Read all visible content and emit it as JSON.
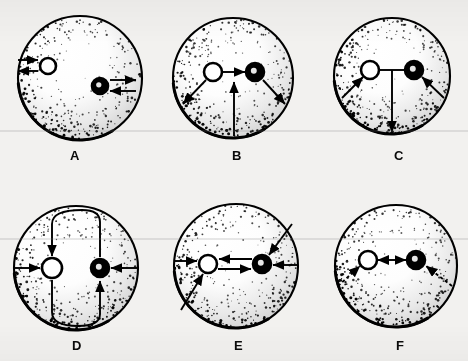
{
  "figure": {
    "background_color": "#f2f1ef",
    "ink_color": "#000000",
    "panel_count": 6,
    "sphere_fill": "#ffffff",
    "sphere_outline": "#000000"
  },
  "markers": {
    "open_circle_name": "open-circle-marker",
    "filled_circle_name": "filled-circle-marker",
    "open_fill": "#ffffff",
    "filled_fill": "#000000"
  },
  "panels": [
    {
      "id": "A",
      "label": "A",
      "label_x": 70,
      "label_y": 148,
      "cx": 80,
      "cy": 78,
      "r": 62,
      "open_marker": {
        "x": -32,
        "y": -12,
        "r": 8
      },
      "filled_marker": {
        "x": 20,
        "y": 8,
        "r": 8
      },
      "arrows": [
        {
          "name": "inward-arrow-left-open",
          "x1": -62,
          "y1": -18,
          "x2": -42,
          "y2": -18,
          "head": "end",
          "style": "solid"
        },
        {
          "name": "outward-arrow-left-open",
          "x1": -42,
          "y1": -7,
          "x2": -62,
          "y2": -7,
          "head": "end",
          "style": "solid"
        },
        {
          "name": "outward-arrow-right-filled",
          "x1": 30,
          "y1": 2,
          "x2": 56,
          "y2": 2,
          "head": "end",
          "style": "solid"
        },
        {
          "name": "inward-arrow-right-filled",
          "x1": 56,
          "y1": 13,
          "x2": 30,
          "y2": 13,
          "head": "end",
          "style": "solid"
        }
      ]
    },
    {
      "id": "B",
      "label": "B",
      "label_x": 232,
      "label_y": 148,
      "cx": 233,
      "cy": 78,
      "r": 60,
      "open_marker": {
        "x": -20,
        "y": -6,
        "r": 9
      },
      "filled_marker": {
        "x": 22,
        "y": -6,
        "r": 9
      },
      "arrows": [
        {
          "name": "connector-arrow-open-to-filled",
          "x1": -10,
          "y1": -6,
          "x2": 12,
          "y2": -6,
          "head": "end",
          "style": "solid"
        },
        {
          "name": "outward-arrow-down-left",
          "x1": -27,
          "y1": 2,
          "x2": -50,
          "y2": 26,
          "head": "end",
          "style": "solid"
        },
        {
          "name": "outward-arrow-down-right",
          "x1": 30,
          "y1": 2,
          "x2": 52,
          "y2": 26,
          "head": "end",
          "style": "solid"
        },
        {
          "name": "upward-arrow-from-bottom",
          "x1": 1,
          "y1": 58,
          "x2": 1,
          "y2": 4,
          "head": "end",
          "style": "solid"
        }
      ]
    },
    {
      "id": "C",
      "label": "C",
      "label_x": 394,
      "label_y": 148,
      "cx": 392,
      "cy": 76,
      "r": 58,
      "open_marker": {
        "x": -22,
        "y": -6,
        "r": 9
      },
      "filled_marker": {
        "x": 22,
        "y": -6,
        "r": 9
      },
      "arrows": [
        {
          "name": "connector-line-open-to-filled",
          "x1": -13,
          "y1": -6,
          "x2": 13,
          "y2": -6,
          "head": "none",
          "style": "solid"
        },
        {
          "name": "inward-arrow-up-left",
          "x1": -50,
          "y1": 22,
          "x2": -29,
          "y2": 1,
          "head": "end",
          "style": "solid"
        },
        {
          "name": "inward-arrow-up-right",
          "x1": 52,
          "y1": 22,
          "x2": 30,
          "y2": 1,
          "head": "end",
          "style": "solid"
        },
        {
          "name": "downward-arrow-to-bottom",
          "x1": 0,
          "y1": -6,
          "x2": 0,
          "y2": 56,
          "head": "end",
          "style": "solid"
        }
      ]
    },
    {
      "id": "D",
      "label": "D",
      "label_x": 72,
      "label_y": 338,
      "cx": 76,
      "cy": 268,
      "r": 62,
      "open_marker": {
        "x": -24,
        "y": 0,
        "r": 10
      },
      "filled_marker": {
        "x": 24,
        "y": 0,
        "r": 9
      },
      "arrows": [
        {
          "name": "inward-arrow-left-open",
          "x1": -62,
          "y1": 0,
          "x2": -36,
          "y2": 0,
          "head": "end",
          "style": "solid"
        },
        {
          "name": "inward-arrow-right-filled",
          "x1": 62,
          "y1": 0,
          "x2": 35,
          "y2": 0,
          "head": "end",
          "style": "solid"
        }
      ],
      "loops": [
        {
          "name": "upper-circulation-loop",
          "path": "M 24 -11 L 24 -46 Q 24 -58 6 -58 Q -24 -58 -24 -44 L -24 -12",
          "head": "end"
        },
        {
          "name": "lower-circulation-loop",
          "path": "M -24 12 L -24 44 Q -24 58 2 58 Q 24 58 24 46 L 24 13",
          "head": "end"
        }
      ]
    },
    {
      "id": "E",
      "label": "E",
      "label_x": 234,
      "label_y": 338,
      "cx": 236,
      "cy": 266,
      "r": 62,
      "open_marker": {
        "x": -28,
        "y": -2,
        "r": 9
      },
      "filled_marker": {
        "x": 26,
        "y": -2,
        "r": 9
      },
      "arrows": [
        {
          "name": "inward-arrow-left-open",
          "x1": -62,
          "y1": -5,
          "x2": -39,
          "y2": -5,
          "head": "end",
          "style": "solid"
        },
        {
          "name": "inward-arrow-right-filled",
          "x1": 62,
          "y1": -1,
          "x2": 37,
          "y2": -1,
          "head": "end",
          "style": "solid"
        },
        {
          "name": "connector-arrow-filled-to-open",
          "x1": 16,
          "y1": -7,
          "x2": -17,
          "y2": -7,
          "head": "end",
          "style": "solid"
        },
        {
          "name": "connector-arrow-open-to-filled",
          "x1": -18,
          "y1": 3,
          "x2": 15,
          "y2": 3,
          "head": "end",
          "style": "solid"
        },
        {
          "name": "inward-arrow-up-right-diagonal",
          "x1": 56,
          "y1": -42,
          "x2": 33,
          "y2": -11,
          "head": "end",
          "style": "solid"
        },
        {
          "name": "inward-arrow-up-left-diagonal",
          "x1": -55,
          "y1": 44,
          "x2": -33,
          "y2": 8,
          "head": "end",
          "style": "solid"
        }
      ]
    },
    {
      "id": "F",
      "label": "F",
      "label_x": 396,
      "label_y": 338,
      "cx": 396,
      "cy": 266,
      "r": 61,
      "open_marker": {
        "x": -28,
        "y": -6,
        "r": 9
      },
      "filled_marker": {
        "x": 20,
        "y": -6,
        "r": 9
      },
      "arrows": [
        {
          "name": "connector-double-arrow",
          "x1": -18,
          "y1": -6,
          "x2": 10,
          "y2": -6,
          "head": "both",
          "style": "solid"
        },
        {
          "name": "dashed-arrow-up-left",
          "x1": -58,
          "y1": 20,
          "x2": -36,
          "y2": 0,
          "head": "end",
          "style": "dashed"
        },
        {
          "name": "dashed-arrow-up-right",
          "x1": 56,
          "y1": 20,
          "x2": 30,
          "y2": 0,
          "head": "end",
          "style": "dashed"
        }
      ]
    }
  ]
}
